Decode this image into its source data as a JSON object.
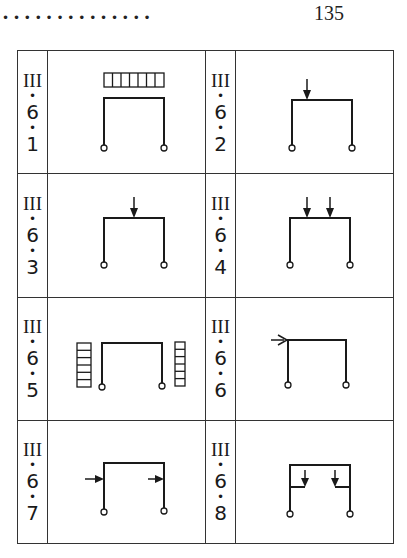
{
  "header": {
    "leader_dots": "• • • • • • • • • • • • • •",
    "page_number": "135"
  },
  "table": {
    "rows": [
      [
        {
          "chapter": "III",
          "section": "6",
          "item": "1",
          "diagram": "frame-with-distributed-load-on-top"
        },
        {
          "chapter": "III",
          "section": "6",
          "item": "2",
          "diagram": "frame-with-point-load-at-left-third"
        }
      ],
      [
        {
          "chapter": "III",
          "section": "6",
          "item": "3",
          "diagram": "frame-with-point-load-at-center"
        },
        {
          "chapter": "III",
          "section": "6",
          "item": "4",
          "diagram": "frame-with-two-point-loads"
        }
      ],
      [
        {
          "chapter": "III",
          "section": "6",
          "item": "5",
          "diagram": "frame-with-lateral-distributed-loads-both-sides"
        },
        {
          "chapter": "III",
          "section": "6",
          "item": "6",
          "diagram": "frame-with-horizontal-load-at-top-left"
        }
      ],
      [
        {
          "chapter": "III",
          "section": "6",
          "item": "7",
          "diagram": "frame-with-horizontal-loads-on-both-columns"
        },
        {
          "chapter": "III",
          "section": "6",
          "item": "8",
          "diagram": "frame-with-brackets-and-point-loads"
        }
      ]
    ]
  },
  "colors": {
    "ink": "#1a1a1a",
    "background": "#ffffff"
  }
}
